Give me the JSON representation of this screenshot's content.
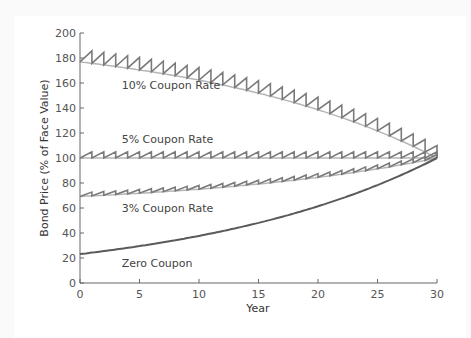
{
  "chart_data": {
    "type": "line",
    "title": "",
    "xlabel": "Year",
    "ylabel": "Bond Price (% of Face Value)",
    "xlim": [
      0,
      30
    ],
    "ylim": [
      0,
      200
    ],
    "xticks": [
      0,
      5,
      10,
      15,
      20,
      25,
      30
    ],
    "yticks": [
      0,
      20,
      40,
      60,
      80,
      100,
      120,
      140,
      160,
      180,
      200
    ],
    "grid": false,
    "yield_rate": 0.05,
    "maturity_years": 30,
    "face_value": 100,
    "series": [
      {
        "name": "10% Coupon Rate",
        "coupon": 10,
        "start_price": 176.9,
        "end_price": 100,
        "sawtooth": true,
        "label_x": 3.5,
        "label_y": 155
      },
      {
        "name": "5% Coupon Rate",
        "coupon": 5,
        "start_price": 100,
        "end_price": 100,
        "sawtooth": true,
        "label_x": 3.5,
        "label_y": 112
      },
      {
        "name": "3% Coupon Rate",
        "coupon": 3,
        "start_price": 69.3,
        "end_price": 100,
        "sawtooth": true,
        "label_x": 3.5,
        "label_y": 57
      },
      {
        "name": "Zero Coupon",
        "coupon": 0,
        "start_price": 23.1,
        "end_price": 100,
        "sawtooth": false,
        "label_x": 3.5,
        "label_y": 13
      }
    ],
    "colors": {
      "sawtooth": "#7a7a7a",
      "clean": "#b5b5b5",
      "zero": "#5a5a5a",
      "axis": "#666666"
    }
  }
}
